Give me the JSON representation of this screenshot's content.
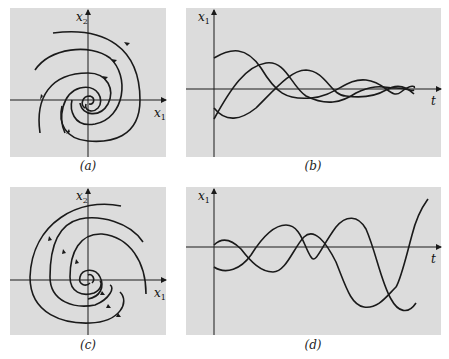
{
  "figure": {
    "panels": [
      {
        "id": "a",
        "caption": "(a)",
        "kind": "phase-portrait",
        "description": "Stable focus: trajectories spiral inward toward origin (clockwise)",
        "x_axis_label": "x",
        "x_axis_sub": "1",
        "y_axis_label": "x",
        "y_axis_sub": "2",
        "box": [
          10,
          8,
          156,
          149
        ]
      },
      {
        "id": "b",
        "caption": "(b)",
        "kind": "time-series",
        "description": "Damped oscillations of x1 decaying to zero",
        "x_axis_label": "t",
        "x_axis_sub": "",
        "y_axis_label": "x",
        "y_axis_sub": "1",
        "box": [
          186,
          8,
          255,
          149
        ]
      },
      {
        "id": "c",
        "caption": "(c)",
        "kind": "phase-portrait",
        "description": "Unstable focus: trajectories spiral outward from origin",
        "x_axis_label": "x",
        "x_axis_sub": "1",
        "y_axis_label": "x",
        "y_axis_sub": "2",
        "box": [
          10,
          187,
          156,
          148
        ]
      },
      {
        "id": "d",
        "caption": "(d)",
        "kind": "time-series",
        "description": "Growing oscillations of x1",
        "x_axis_label": "t",
        "x_axis_sub": "",
        "y_axis_label": "x",
        "y_axis_sub": "1",
        "box": [
          186,
          187,
          255,
          148
        ]
      }
    ]
  },
  "colors": {
    "panel_bg": "#dcdcdc",
    "ink": "#1a1a1a",
    "page_bg": "#ffffff"
  }
}
